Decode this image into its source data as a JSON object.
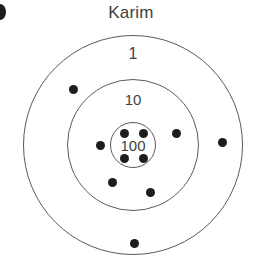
{
  "figure": {
    "title": "Karim",
    "alt_text": "Karim"
  },
  "colors": {
    "ring_stroke": "#5a5a5a",
    "dot_fill": "#1d1d1d",
    "text": "#3f3f3f",
    "background": "#ffffff"
  },
  "chart_data": {
    "type": "scatter",
    "title": "Karim",
    "subtitle": "",
    "xlabel": "",
    "ylabel": "",
    "grid": false,
    "legend_position": "none",
    "center": {
      "x": 133,
      "y": 145
    },
    "rings": [
      {
        "label": "1",
        "score": 1,
        "radius": 110,
        "label_x": 133,
        "label_y": 54,
        "label_font_size": 16,
        "hits": 2
      },
      {
        "label": "10",
        "score": 10,
        "radius": 66,
        "label_x": 133,
        "label_y": 99,
        "label_font_size": 15,
        "hits": 4
      },
      {
        "label": "100",
        "score": 100,
        "radius": 23,
        "label_x": 133,
        "label_y": 145,
        "label_font_size": 15,
        "hits": 4
      }
    ],
    "points": [
      {
        "x": 124,
        "y": 133,
        "r": 4.5,
        "ring": "100",
        "value": 100
      },
      {
        "x": 143,
        "y": 133,
        "r": 4.5,
        "ring": "100",
        "value": 100
      },
      {
        "x": 124,
        "y": 158,
        "r": 4.5,
        "ring": "100",
        "value": 100
      },
      {
        "x": 143,
        "y": 158,
        "r": 4.5,
        "ring": "100",
        "value": 100
      },
      {
        "x": 100,
        "y": 145,
        "r": 4.5,
        "ring": "10",
        "value": 10
      },
      {
        "x": 176,
        "y": 133,
        "r": 4.5,
        "ring": "10",
        "value": 10
      },
      {
        "x": 112,
        "y": 182,
        "r": 4.5,
        "ring": "10",
        "value": 10
      },
      {
        "x": 150,
        "y": 192,
        "r": 4.5,
        "ring": "10",
        "value": 10
      },
      {
        "x": 73,
        "y": 89,
        "r": 4.5,
        "ring": "1",
        "value": 1
      },
      {
        "x": 134,
        "y": 243,
        "r": 4.5,
        "ring": "1",
        "value": 1
      },
      {
        "x": 222,
        "y": 142,
        "r": 4.5,
        "ring": "outside",
        "value": 0
      }
    ],
    "total_points": 11,
    "xlim": [
      0,
      262
    ],
    "ylim": [
      0,
      275
    ]
  }
}
